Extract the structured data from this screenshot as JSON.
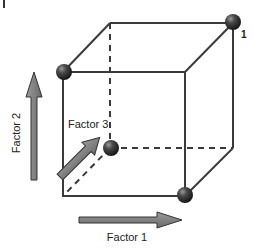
{
  "diagram": {
    "panel_mark": "I",
    "axes": {
      "factor1": {
        "label": "Factor 1",
        "direction": "right"
      },
      "factor2": {
        "label": "Factor 2",
        "direction": "up"
      },
      "factor3": {
        "label": "Factor 3",
        "direction": "depth (diagonal)"
      }
    },
    "corner_label": "1",
    "design_points": [
      {
        "name": "back-top-right",
        "labeled": "1"
      },
      {
        "name": "front-top-left"
      },
      {
        "name": "back-bottom-left"
      },
      {
        "name": "front-bottom-right"
      }
    ],
    "colors": {
      "edges": "#3a3a3a",
      "arrows_fill": "#7a7a7a",
      "arrows_stroke": "#333333",
      "spheres": "#2a2a2a"
    }
  }
}
